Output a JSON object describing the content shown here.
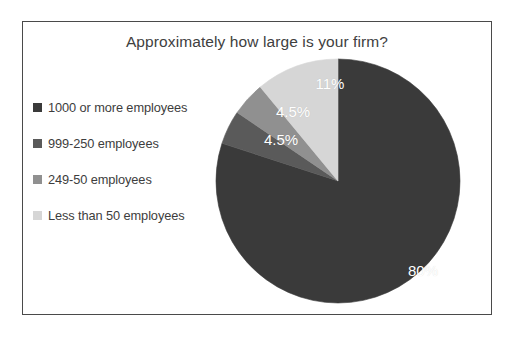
{
  "page": {
    "clipped_top_text": "",
    "background_color": "#ffffff",
    "frame_border_color": "#4a4a4a"
  },
  "chart_data": {
    "type": "pie",
    "title": "Approximately how large is your firm?",
    "xlabel": "",
    "ylabel": "",
    "categories": [
      "1000 or more employees",
      "999-250 employees",
      "249-50 employees",
      "Less than 50 employees"
    ],
    "values": [
      80,
      4.5,
      4.5,
      11
    ],
    "value_labels": [
      "80%",
      "4.5%",
      "4.5%",
      "11%"
    ],
    "colors": [
      "#3a3a3a",
      "#5a5a5a",
      "#909090",
      "#d6d6d6"
    ],
    "label_color": "#ffffff",
    "legend_position": "left",
    "grid": false,
    "start_angle_deg": 0,
    "direction": "clockwise"
  },
  "legend": {
    "items": [
      {
        "label": "1000 or more employees",
        "color": "#3a3a3a"
      },
      {
        "label": "999-250 employees",
        "color": "#5a5a5a"
      },
      {
        "label": "249-50 employees",
        "color": "#909090"
      },
      {
        "label": "Less than 50 employees",
        "color": "#d6d6d6"
      }
    ]
  },
  "slice_labels": [
    {
      "text": "80%",
      "x": 400,
      "y": 248
    },
    {
      "text": "4.5%",
      "x": 258,
      "y": 117
    },
    {
      "text": "4.5%",
      "x": 270,
      "y": 89
    },
    {
      "text": "11%",
      "x": 307,
      "y": 61
    }
  ]
}
